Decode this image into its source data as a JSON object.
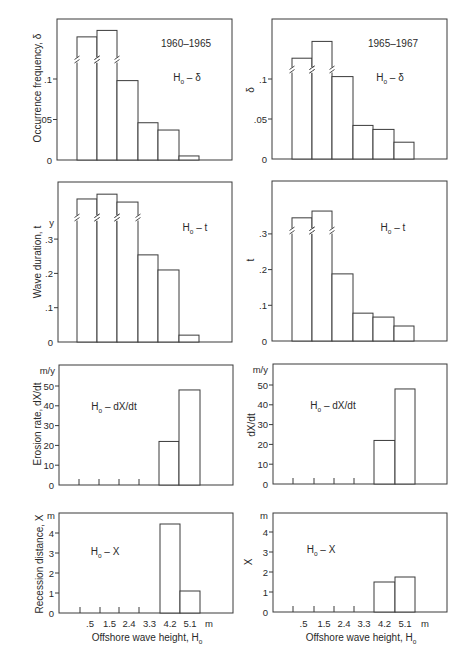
{
  "figure": {
    "columns": [
      "1960–1965",
      "1965–1967"
    ],
    "rows": [
      "Ho – δ",
      "Ho – t",
      "Ho – dX/dt",
      "Ho – X"
    ]
  },
  "chart_data": [
    {
      "type": "bar",
      "title": "1960–1965",
      "annotation": {
        "main": "H",
        "sub": "o",
        "rest": " – δ"
      },
      "ylabel": "Occurrence frequency, δ",
      "yunit": "",
      "yticks": [
        {
          "value": 0,
          "label": "0"
        },
        {
          "value": 0.05,
          "label": ".05"
        },
        {
          "value": 0.1,
          "label": ".1"
        }
      ],
      "categories": [
        ".5",
        "1.5",
        "2.4",
        "3.3",
        "4.2",
        "5.1"
      ],
      "xunit": "m",
      "values": [
        0.152,
        0.16,
        0.098,
        0.046,
        0.037,
        0.005
      ],
      "broken_bars": [
        0,
        1
      ],
      "ylim": [
        0,
        0.17
      ],
      "grid": false
    },
    {
      "type": "bar",
      "title": "1965–1967",
      "annotation": {
        "main": "H",
        "sub": "o",
        "rest": " – δ"
      },
      "ylabel": "δ",
      "yunit": "",
      "yticks": [
        {
          "value": 0,
          "label": "0"
        },
        {
          "value": 0.05,
          "label": ".05"
        },
        {
          "value": 0.1,
          "label": ".1"
        }
      ],
      "categories": [
        ".5",
        "1.5",
        "2.4",
        "3.3",
        "4.2",
        "5.1"
      ],
      "xunit": "m",
      "values": [
        0.126,
        0.147,
        0.103,
        0.042,
        0.037,
        0.021
      ],
      "broken_bars": [
        0,
        1
      ],
      "ylim": [
        0,
        0.175
      ],
      "grid": false
    },
    {
      "type": "bar",
      "title": "",
      "annotation": {
        "main": "H",
        "sub": "o",
        "rest": " – t"
      },
      "ylabel": "Wave duration, t",
      "yunit": "y",
      "yticks": [
        {
          "value": 0,
          "label": "0"
        },
        {
          "value": 0.1,
          "label": ".1"
        },
        {
          "value": 0.2,
          "label": ".2"
        },
        {
          "value": 0.3,
          "label": ".3"
        }
      ],
      "categories": [
        ".5",
        "1.5",
        "2.4",
        "3.3",
        "4.2",
        "5.1"
      ],
      "xunit": "m",
      "values": [
        0.417,
        0.431,
        0.408,
        0.254,
        0.21,
        0.02
      ],
      "broken_bars": [
        0,
        1,
        2
      ],
      "ylim": [
        0,
        0.47
      ],
      "grid": false
    },
    {
      "type": "bar",
      "title": "",
      "annotation": {
        "main": "H",
        "sub": "o",
        "rest": " – t"
      },
      "ylabel": "t",
      "yunit": "",
      "yticks": [
        {
          "value": 0,
          "label": "0"
        },
        {
          "value": 0.1,
          "label": ".1"
        },
        {
          "value": 0.2,
          "label": ".2"
        },
        {
          "value": 0.3,
          "label": ".3"
        }
      ],
      "categories": [
        ".5",
        "1.5",
        "2.4",
        "3.3",
        "4.2",
        "5.1"
      ],
      "xunit": "m",
      "values": [
        0.345,
        0.364,
        0.188,
        0.078,
        0.067,
        0.042
      ],
      "broken_bars": [
        0,
        1
      ],
      "ylim": [
        0,
        0.45
      ],
      "grid": false
    },
    {
      "type": "bar",
      "title": "",
      "annotation": {
        "main": "H",
        "sub": "o",
        "rest": " – dX/dt"
      },
      "ylabel": "Erosion rate, dX/dt",
      "yunit": "m/y",
      "yticks": [
        {
          "value": 0,
          "label": "0"
        },
        {
          "value": 10,
          "label": "10"
        },
        {
          "value": 20,
          "label": "20"
        },
        {
          "value": 30,
          "label": "30"
        },
        {
          "value": 40,
          "label": "40"
        },
        {
          "value": 50,
          "label": "50"
        }
      ],
      "categories": [
        ".5",
        "1.5",
        "2.4",
        "3.3",
        "4.2",
        "5.1"
      ],
      "xunit": "m",
      "values": [
        0,
        0,
        0,
        0,
        22,
        48
      ],
      "broken_bars": [],
      "ylim": [
        0,
        60
      ],
      "grid": false
    },
    {
      "type": "bar",
      "title": "",
      "annotation": {
        "main": "H",
        "sub": "o",
        "rest": " – dX/dt"
      },
      "ylabel": "dX/dt",
      "yunit": "m/y",
      "yticks": [
        {
          "value": 0,
          "label": "0"
        },
        {
          "value": 10,
          "label": "10"
        },
        {
          "value": 20,
          "label": "20"
        },
        {
          "value": 30,
          "label": "30"
        },
        {
          "value": 40,
          "label": "40"
        },
        {
          "value": 50,
          "label": "50"
        }
      ],
      "categories": [
        ".5",
        "1.5",
        "2.4",
        "3.3",
        "4.2",
        "5.1"
      ],
      "xunit": "m",
      "values": [
        0,
        0,
        0,
        0,
        22,
        48
      ],
      "broken_bars": [],
      "ylim": [
        0,
        60
      ],
      "grid": false
    },
    {
      "type": "bar",
      "title": "",
      "annotation": {
        "main": "H",
        "sub": "o",
        "rest": " – X"
      },
      "ylabel": "Recession distance, X",
      "yunit": "m",
      "yticks": [
        {
          "value": 0,
          "label": "0"
        },
        {
          "value": 1,
          "label": "1"
        },
        {
          "value": 2,
          "label": "2"
        },
        {
          "value": 3,
          "label": "3"
        },
        {
          "value": 4,
          "label": "4"
        }
      ],
      "categories": [
        ".5",
        "1.5",
        "2.4",
        "3.3",
        "4.2",
        "5.1"
      ],
      "xunit": "m",
      "xlabel": "Offshore wave height, H",
      "xlabel_sub": "o",
      "values": [
        0,
        0,
        0,
        0,
        4.45,
        1.1
      ],
      "broken_bars": [],
      "ylim": [
        0,
        5
      ],
      "grid": false
    },
    {
      "type": "bar",
      "title": "",
      "annotation": {
        "main": "H",
        "sub": "o",
        "rest": " – X"
      },
      "ylabel": "X",
      "yunit": "m",
      "yticks": [
        {
          "value": 0,
          "label": "0"
        },
        {
          "value": 1,
          "label": "1"
        },
        {
          "value": 2,
          "label": "2"
        },
        {
          "value": 3,
          "label": "3"
        },
        {
          "value": 4,
          "label": "4"
        }
      ],
      "categories": [
        ".5",
        "1.5",
        "2.4",
        "3.3",
        "4.2",
        "5.1"
      ],
      "xunit": "m",
      "xlabel": "Offshore wave height, H",
      "xlabel_sub": "o",
      "values": [
        0,
        0,
        0,
        0,
        1.5,
        1.75
      ],
      "broken_bars": [],
      "ylim": [
        0,
        5
      ],
      "grid": false
    }
  ]
}
